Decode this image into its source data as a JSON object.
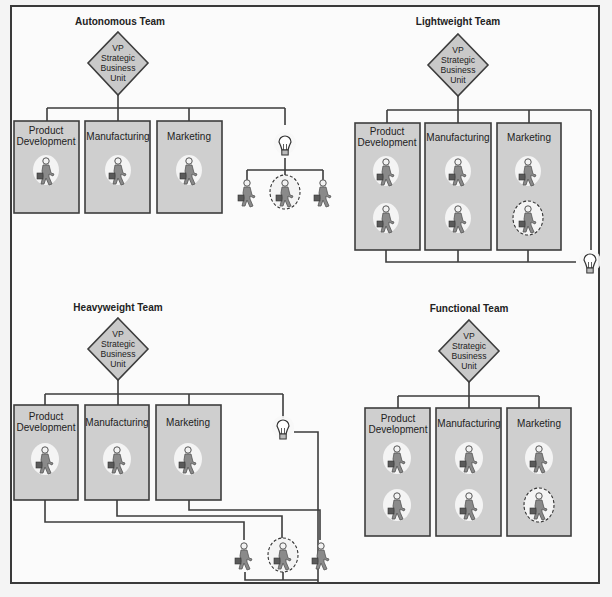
{
  "colors": {
    "frame": "#3a3a3a",
    "box_fill": "#cfcfcf",
    "diamond_fill": "#c9c9c9",
    "line": "#3d3d3d",
    "figure": "#777777",
    "figure_halo": "#f4f4f4"
  },
  "vp_label_lines": [
    "VP",
    "Strategic",
    "Business",
    "Unit"
  ],
  "icons": {
    "person": "person-with-briefcase-icon",
    "lightbulb": "lightbulb-icon",
    "team_leader_marker": "dashed-circle"
  },
  "panels": [
    {
      "id": "autonomous",
      "title": "Autonomous Team",
      "departments": [
        {
          "name_lines": [
            "Product",
            "Development"
          ],
          "people": 1
        },
        {
          "name_lines": [
            "Manufacturing"
          ],
          "people": 1
        },
        {
          "name_lines": [
            "Marketing"
          ],
          "people": 1
        }
      ],
      "project_team": {
        "people": 3,
        "leader_index": 1,
        "reports_to": "VP Strategic Business Unit",
        "separate_from_functions": true
      }
    },
    {
      "id": "lightweight",
      "title": "Lightweight Team",
      "departments": [
        {
          "name_lines": [
            "Product",
            "Development"
          ],
          "people": 2
        },
        {
          "name_lines": [
            "Manufacturing"
          ],
          "people": 2
        },
        {
          "name_lines": [
            "Marketing"
          ],
          "people": 2,
          "leader_index": 1
        }
      ],
      "project": {
        "leader_within": "Marketing",
        "members_remain_in_functions": true
      }
    },
    {
      "id": "heavyweight",
      "title": "Heavyweight Team",
      "departments": [
        {
          "name_lines": [
            "Product",
            "Development"
          ],
          "people": 1
        },
        {
          "name_lines": [
            "Manufacturing"
          ],
          "people": 1
        },
        {
          "name_lines": [
            "Marketing"
          ],
          "people": 1
        }
      ],
      "project_team": {
        "people": 3,
        "leader_index": 1,
        "members_drawn_from_functions": true
      }
    },
    {
      "id": "functional",
      "title": "Functional Team",
      "departments": [
        {
          "name_lines": [
            "Product",
            "Development"
          ],
          "people": 2
        },
        {
          "name_lines": [
            "Manufacturing"
          ],
          "people": 2
        },
        {
          "name_lines": [
            "Marketing"
          ],
          "people": 2,
          "leader_index": 1
        }
      ],
      "project": {
        "no_project_link": true
      }
    }
  ]
}
